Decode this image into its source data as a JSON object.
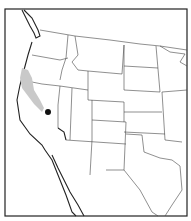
{
  "map": {
    "region": "Western United States and northern Mexico",
    "colors": {
      "background": "#ffffff",
      "border": "#222222",
      "range_fill": "#c9c9c9",
      "locality_dot": "#111111"
    },
    "layers": [
      {
        "name": "state-boundaries"
      },
      {
        "name": "range-shading",
        "description": "gray stippled distribution along central California"
      },
      {
        "name": "locality-point",
        "description": "single black dot in east-central California"
      }
    ]
  }
}
